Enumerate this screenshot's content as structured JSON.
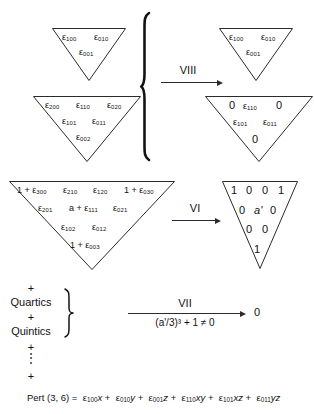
{
  "figure": {
    "caption": "Pert (3, 6) = ε100x + ε010y + ε001z + ε110xy + ε101xz + ε011yz"
  },
  "row1": {
    "left_triangle": {
      "name": "linear-terms-triangle",
      "rows": [
        [
          "ε",
          "100",
          "ε",
          "010"
        ],
        [
          "ε",
          "001"
        ]
      ],
      "line1": [
        "ε100",
        "ε010"
      ],
      "line2": [
        "ε001"
      ]
    },
    "right_triangle": {
      "name": "linear-terms-triangle-result",
      "line1": [
        "ε100",
        "ε010"
      ],
      "line2": [
        "ε001"
      ]
    }
  },
  "row2": {
    "left_triangle": {
      "name": "quadratic-terms-triangle",
      "line1": [
        "ε200",
        "ε110",
        "ε020"
      ],
      "line2": [
        "ε101",
        "ε011"
      ],
      "line3": [
        "ε002"
      ]
    },
    "right_triangle": {
      "name": "quadratic-terms-triangle-result",
      "line1": [
        "0",
        "ε110",
        "0"
      ],
      "line2": [
        "ε101",
        "ε011"
      ],
      "line3": [
        "0"
      ]
    }
  },
  "row3": {
    "left_triangle": {
      "name": "cubic-terms-triangle",
      "line1": [
        "1 + ε300",
        "ε210",
        "ε120",
        "1 + ε030"
      ],
      "line2": [
        "ε201",
        "a + ε111",
        "ε021"
      ],
      "line3": [
        "ε102",
        "ε012"
      ],
      "line4": [
        "1 + ε003"
      ]
    },
    "right_triangle": {
      "name": "cubic-terms-triangle-result",
      "line1": [
        "1",
        "0",
        "0",
        "1"
      ],
      "line2": [
        "0",
        "a'",
        "0"
      ],
      "line3": [
        "0",
        "0"
      ],
      "line4": [
        "1"
      ]
    }
  },
  "arrows": {
    "viii": {
      "label": "VIII",
      "sublabel": ""
    },
    "vi": {
      "label": "VI",
      "sublabel": ""
    },
    "vii": {
      "label": "VII",
      "sublabel": "(a'/3)³ + 1 ≠ 0",
      "target": "0"
    }
  },
  "stack": {
    "items": [
      {
        "text": "+",
        "kind": "plus"
      },
      {
        "text": "Quartics",
        "kind": "word"
      },
      {
        "text": "+",
        "kind": "plus"
      },
      {
        "text": "Quintics",
        "kind": "word"
      },
      {
        "text": "+",
        "kind": "plus"
      },
      {
        "text": "⋮",
        "kind": "dots"
      },
      {
        "text": "+",
        "kind": "plus"
      }
    ]
  },
  "caption": {
    "lhs": "Pert (3, 6) =",
    "terms": [
      {
        "eps": "100",
        "var": "x"
      },
      {
        "eps": "010",
        "var": "y"
      },
      {
        "eps": "001",
        "var": "z"
      },
      {
        "eps": "110",
        "var": "xy"
      },
      {
        "eps": "101",
        "var": "xz"
      },
      {
        "eps": "011",
        "var": "yz"
      }
    ],
    "sep": "+"
  },
  "colors": {
    "ink": "#2b2b2b",
    "background": "#ffffff"
  }
}
